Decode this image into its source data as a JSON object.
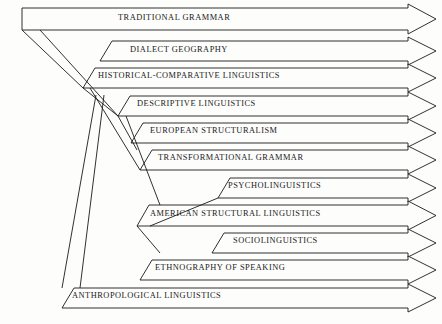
{
  "diagram": {
    "type": "flow-arrow-bands",
    "stroke_color": "#1a1a1a",
    "background_color": "#fdfdfc",
    "arrow_style": "open-chevron",
    "bands": [
      {
        "index": 0,
        "label": "TRADITIONAL GRAMMAR",
        "top_y": 8,
        "bottom_y": 30,
        "start_x": 22,
        "label_x": 118,
        "label_y": 14,
        "corner": "square"
      },
      {
        "index": 1,
        "label": "DIALECT GEOGRAPHY",
        "top_y": 41,
        "bottom_y": 61,
        "start_x": 100,
        "label_x": 130,
        "label_y": 46,
        "corner": "bevel"
      },
      {
        "index": 2,
        "label": "HISTORICAL-COMPARATIVE LINGUISTICS",
        "top_y": 68,
        "bottom_y": 88,
        "start_x": 83,
        "label_x": 98,
        "label_y": 72,
        "corner": "bevel"
      },
      {
        "index": 3,
        "label": "DESCRIPTIVE LINGUISTICS",
        "top_y": 96,
        "bottom_y": 116,
        "start_x": 118,
        "label_x": 137,
        "label_y": 100,
        "corner": "bevel"
      },
      {
        "index": 4,
        "label": "EUROPEAN STRUCTURALISM",
        "top_y": 123,
        "bottom_y": 143,
        "start_x": 131,
        "label_x": 150,
        "label_y": 127,
        "corner": "bevel"
      },
      {
        "index": 5,
        "label": "TRANSFORMATIONAL GRAMMAR",
        "top_y": 150,
        "bottom_y": 170,
        "start_x": 140,
        "label_x": 158,
        "label_y": 154,
        "corner": "bevel"
      },
      {
        "index": 6,
        "label": "PSYCHOLINGUISTICS",
        "top_y": 178,
        "bottom_y": 198,
        "start_x": 218,
        "label_x": 228,
        "label_y": 182,
        "corner": "bevel"
      },
      {
        "index": 7,
        "label": "AMERICAN STRUCTURAL LINGUISTICS",
        "top_y": 205,
        "bottom_y": 226,
        "start_x": 137,
        "label_x": 150,
        "label_y": 210,
        "corner": "bevel"
      },
      {
        "index": 8,
        "label": "SOCIOLINGUISTICS",
        "top_y": 233,
        "bottom_y": 253,
        "start_x": 212,
        "label_x": 233,
        "label_y": 237,
        "corner": "bevel"
      },
      {
        "index": 9,
        "label": "ETHNOGRAPHY OF SPEAKING",
        "top_y": 260,
        "bottom_y": 280,
        "start_x": 140,
        "label_x": 155,
        "label_y": 264,
        "corner": "bevel"
      },
      {
        "index": 10,
        "label": "ANTHROPOLOGICAL LINGUISTICS",
        "top_y": 288,
        "bottom_y": 308,
        "start_x": 62,
        "label_x": 72,
        "label_y": 292,
        "corner": "bevel"
      }
    ],
    "arrow_tip_x": 436,
    "arrow_neck_x": 408,
    "connectors": [
      {
        "from": "traditional-grammar",
        "x1": 22,
        "y1": 30,
        "x2": 83,
        "y2": 88
      },
      {
        "from": "traditional-grammar",
        "x1": 40,
        "y1": 30,
        "x2": 118,
        "y2": 116
      },
      {
        "from": "historical-comparative",
        "x1": 83,
        "y1": 88,
        "x2": 118,
        "y2": 116
      },
      {
        "from": "historical-comparative",
        "x1": 90,
        "y1": 88,
        "x2": 140,
        "y2": 170
      },
      {
        "from": "descriptive",
        "x1": 118,
        "y1": 116,
        "x2": 137,
        "y2": 150
      },
      {
        "from": "descriptive",
        "x1": 126,
        "y1": 116,
        "x2": 160,
        "y2": 205
      },
      {
        "from": "anthropological-up",
        "x1": 62,
        "y1": 288,
        "x2": 96,
        "y2": 95
      },
      {
        "from": "anthropological-up2",
        "x1": 80,
        "y1": 288,
        "x2": 104,
        "y2": 95
      },
      {
        "from": "american-structural",
        "x1": 137,
        "y1": 226,
        "x2": 160,
        "y2": 253
      },
      {
        "from": "american-structural2",
        "x1": 150,
        "y1": 226,
        "x2": 218,
        "y2": 198
      }
    ],
    "reading_order": [
      "TRADITIONAL GRAMMAR",
      "DIALECT GEOGRAPHY",
      "HISTORICAL-COMPARATIVE LINGUISTICS",
      "DESCRIPTIVE LINGUISTICS",
      "EUROPEAN STRUCTURALISM",
      "TRANSFORMATIONAL GRAMMAR",
      "PSYCHOLINGUISTICS",
      "AMERICAN STRUCTURAL LINGUISTICS",
      "SOCIOLINGUISTICS",
      "ETHNOGRAPHY OF SPEAKING",
      "ANTHROPOLOGICAL LINGUISTICS"
    ]
  }
}
